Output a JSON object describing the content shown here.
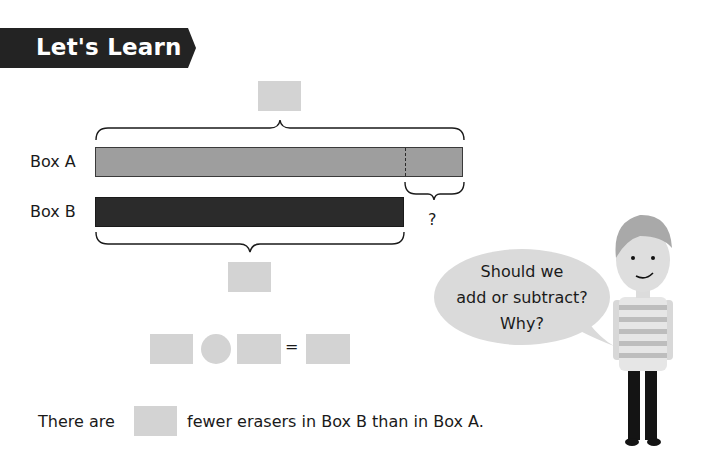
{
  "header": {
    "banner_title": "Let's Learn",
    "banner_color": "#232323"
  },
  "bar_model": {
    "box_a_label": "Box A",
    "box_b_label": "Box B",
    "difference_label": "?",
    "box_a_color": "#9e9e9e",
    "box_b_color": "#2b2b2b",
    "blank_color": "#d3d3d3"
  },
  "equation": {
    "operator_placeholder": "circle",
    "equals_sign": "="
  },
  "speech_bubble": {
    "lines": [
      "Should we",
      "add or subtract?",
      "Why?"
    ]
  },
  "sentence": {
    "before_blank": "There are",
    "after_blank": "fewer erasers in Box B than in Box A."
  }
}
